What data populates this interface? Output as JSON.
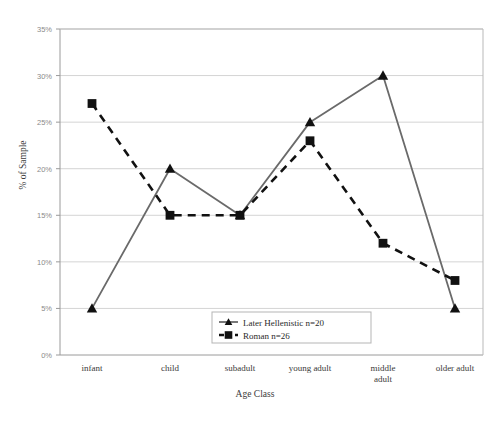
{
  "chart_data": {
    "type": "line",
    "title": "",
    "xlabel": "Age Class",
    "ylabel": "% of Sample",
    "categories": [
      "infant",
      "child",
      "subadult",
      "young adult",
      "middle adult",
      "older adult"
    ],
    "ylim": [
      0,
      35
    ],
    "ytick_values": [
      0,
      5,
      10,
      15,
      20,
      25,
      30,
      35
    ],
    "ytick_labels": [
      "0%",
      "5%",
      "10%",
      "15%",
      "20%",
      "25%",
      "30%",
      "35%"
    ],
    "grid": true,
    "legend_position": "inside-bottom-center",
    "series": [
      {
        "name": "Later Hellenistic n=20",
        "values": [
          5,
          20,
          15,
          25,
          30,
          5
        ],
        "marker": "triangle",
        "linestyle": "solid",
        "color": "#6a6a6a",
        "marker_color": "#111111"
      },
      {
        "name": "Roman n=26",
        "values": [
          27,
          15,
          15,
          23,
          12,
          8
        ],
        "marker": "square",
        "linestyle": "dashed",
        "color": "#111111",
        "marker_color": "#111111"
      }
    ]
  },
  "colors": {
    "plot_border": "#9a9a9a",
    "gridline": "#d4d4d4",
    "hellenistic_line": "#6a6a6a",
    "roman_line": "#111111",
    "legend_border": "#b5b5b5",
    "background": "#ffffff"
  },
  "legend": {
    "items": [
      {
        "label": "Later Hellenistic n=20",
        "marker": "triangle-icon",
        "linestyle": "solid"
      },
      {
        "label": "Roman n=26",
        "marker": "square-icon",
        "linestyle": "dashed"
      }
    ]
  },
  "axes": {
    "x_title": "Age Class",
    "y_title": "% of Sample"
  }
}
